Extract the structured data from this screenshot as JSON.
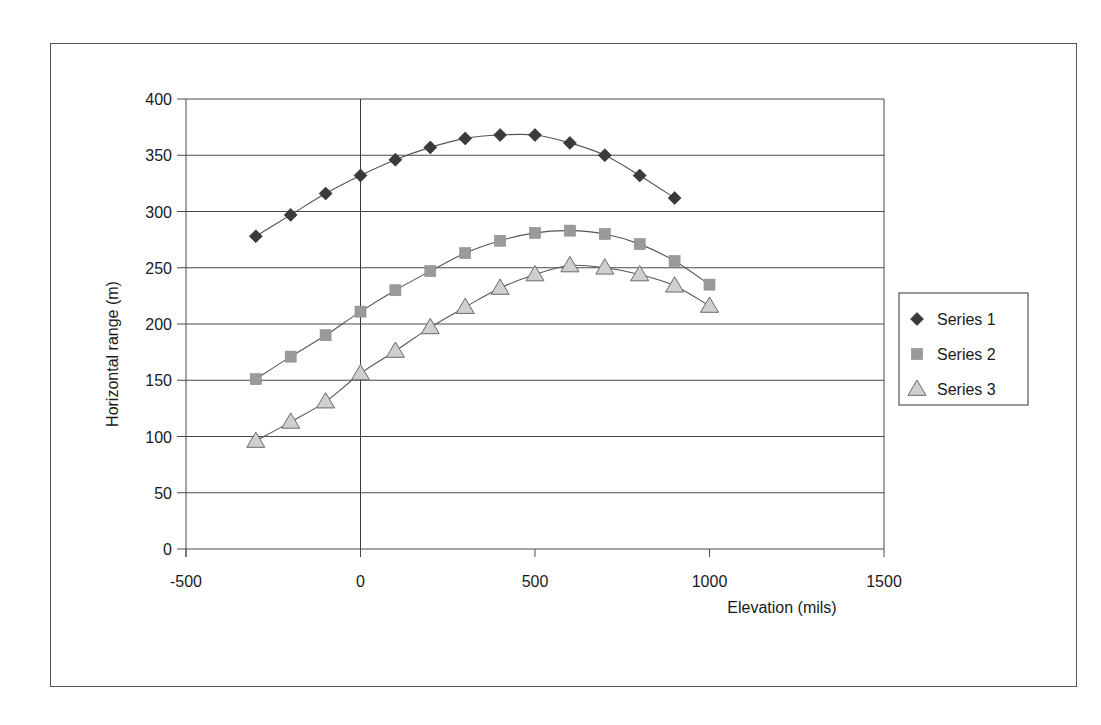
{
  "chart_data": {
    "type": "scatter",
    "title": "",
    "xlabel": "Elevation (mils)",
    "ylabel": "Horizontal range (m)",
    "xlim": [
      -500,
      1500
    ],
    "ylim": [
      0,
      400
    ],
    "x_ticks": [
      -500,
      0,
      500,
      1000,
      1500
    ],
    "y_ticks": [
      0,
      50,
      100,
      150,
      200,
      250,
      300,
      350,
      400
    ],
    "grid": {
      "horizontal": true,
      "vertical": false
    },
    "legend_position": "right",
    "series": [
      {
        "name": "Series 1",
        "marker": "diamond",
        "color": "#3a3a3a",
        "x": [
          -300,
          -200,
          -100,
          0,
          100,
          200,
          300,
          400,
          500,
          600,
          700,
          800,
          900
        ],
        "y": [
          278,
          297,
          316,
          332,
          346,
          357,
          365,
          368,
          368,
          361,
          350,
          332,
          312
        ]
      },
      {
        "name": "Series 2",
        "marker": "square",
        "color": "#9a9a9a",
        "x": [
          -300,
          -200,
          -100,
          0,
          100,
          200,
          300,
          400,
          500,
          600,
          700,
          800,
          900,
          1000
        ],
        "y": [
          151,
          171,
          190,
          211,
          230,
          247,
          263,
          274,
          281,
          283,
          280,
          271,
          256,
          235
        ]
      },
      {
        "name": "Series 3",
        "marker": "triangle",
        "color": "#cfcfcf",
        "x": [
          -300,
          -200,
          -100,
          0,
          100,
          200,
          300,
          400,
          500,
          600,
          700,
          800,
          900,
          1000
        ],
        "y": [
          96,
          113,
          131,
          156,
          176,
          197,
          215,
          232,
          244,
          252,
          250,
          244,
          234,
          216
        ]
      }
    ]
  }
}
